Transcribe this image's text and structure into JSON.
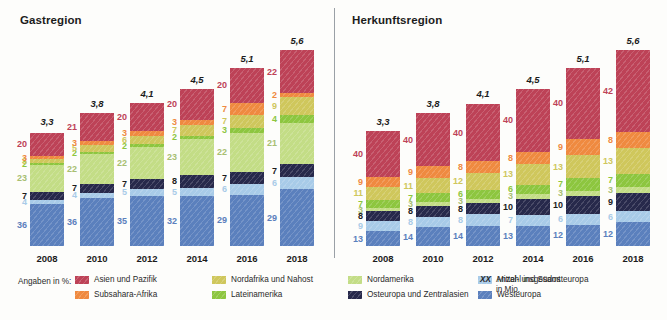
{
  "legend": {
    "intro": "Angaben in %:",
    "items": [
      {
        "label": "Asien und Pazifik",
        "key": "asia",
        "color": "#bd4257"
      },
      {
        "label": "Subsahara-Afrika",
        "key": "ssa",
        "color": "#ef8a40"
      },
      {
        "label": "Nordafrika und Nahost",
        "key": "mena",
        "color": "#cfc75c"
      },
      {
        "label": "Lateinamerika",
        "key": "latam",
        "color": "#8dc63f"
      },
      {
        "label": "Nordamerika",
        "key": "northam",
        "color": "#c3dd86"
      },
      {
        "label": "Osteuropa und Zentralasien",
        "key": "eeca",
        "color": "#27294b"
      },
      {
        "label": "Mittel- und Südosteuropa",
        "key": "cese",
        "color": "#a8cbe8"
      },
      {
        "label": "Westeuropa",
        "key": "westeu",
        "color": "#5b80bd"
      }
    ],
    "note_mark": "XX",
    "note_line1": "Anzahl insgesamt",
    "note_line2": "in Mio."
  },
  "chart_data": [
    {
      "type": "bar",
      "title": "Gastregion",
      "stacked": true,
      "unit": "%",
      "xlabel": "",
      "ylabel": "",
      "categories": [
        "2008",
        "2010",
        "2012",
        "2014",
        "2016",
        "2018"
      ],
      "totals": [
        "3,3",
        "3,8",
        "4,1",
        "4,5",
        "5,1",
        "5,6"
      ],
      "totals_numeric": [
        3.3,
        3.8,
        4.1,
        4.5,
        5.1,
        5.6
      ],
      "totals_unit": "Mio.",
      "series": [
        {
          "name": "Westeuropa",
          "color": "#5b80bd",
          "values": [
            36,
            36,
            35,
            32,
            29,
            29
          ]
        },
        {
          "name": "Mittel- und Südosteuropa",
          "color": "#a8cbe8",
          "values": [
            4,
            4,
            5,
            5,
            6,
            6
          ]
        },
        {
          "name": "Osteuropa und Zentralasien",
          "color": "#27294b",
          "values": [
            7,
            7,
            7,
            8,
            7,
            7
          ]
        },
        {
          "name": "Nordamerika",
          "color": "#c3dd86",
          "values": [
            23,
            22,
            22,
            23,
            22,
            21
          ]
        },
        {
          "name": "Lateinamerika",
          "color": "#8dc63f",
          "values": [
            2,
            2,
            2,
            2,
            3,
            4
          ]
        },
        {
          "name": "Nordafrika und Nahost",
          "color": "#cfc75c",
          "values": [
            3,
            5,
            6,
            7,
            7,
            9
          ]
        },
        {
          "name": "Subsahara-Afrika",
          "color": "#ef8a40",
          "values": [
            3,
            3,
            3,
            3,
            7,
            2
          ]
        },
        {
          "name": "Asien und Pazifik",
          "color": "#bd4257",
          "values": [
            20,
            21,
            20,
            20,
            20,
            22
          ]
        }
      ]
    },
    {
      "type": "bar",
      "title": "Herkunftsregion",
      "stacked": true,
      "unit": "%",
      "xlabel": "",
      "ylabel": "",
      "categories": [
        "2008",
        "2010",
        "2012",
        "2014",
        "2016",
        "2018"
      ],
      "totals": [
        "3,3",
        "3,8",
        "4,1",
        "4,5",
        "5,1",
        "5,6"
      ],
      "totals_numeric": [
        3.3,
        3.8,
        4.1,
        4.5,
        5.1,
        5.6
      ],
      "totals_unit": "Mio.",
      "series": [
        {
          "name": "Westeuropa",
          "color": "#5b80bd",
          "values": [
            13,
            14,
            14,
            13,
            12,
            12
          ]
        },
        {
          "name": "Mittel- und Südosteuropa",
          "color": "#a8cbe8",
          "values": [
            9,
            8,
            8,
            7,
            6,
            6
          ]
        },
        {
          "name": "Osteuropa und Zentralasien",
          "color": "#27294b",
          "values": [
            8,
            8,
            8,
            10,
            10,
            9
          ]
        },
        {
          "name": "Nordamerika",
          "color": "#c3dd86",
          "values": [
            3,
            3,
            3,
            3,
            3,
            3
          ]
        },
        {
          "name": "Lateinamerika",
          "color": "#8dc63f",
          "values": [
            7,
            7,
            6,
            6,
            7,
            7
          ]
        },
        {
          "name": "Nordafrika und Nahost",
          "color": "#cfc75c",
          "values": [
            11,
            11,
            12,
            13,
            13,
            13
          ]
        },
        {
          "name": "Subsahara-Afrika",
          "color": "#ef8a40",
          "values": [
            9,
            9,
            8,
            8,
            9,
            8
          ]
        },
        {
          "name": "Asien und Pazifik",
          "color": "#bd4257",
          "values": [
            40,
            40,
            40,
            40,
            40,
            42
          ]
        }
      ]
    }
  ]
}
